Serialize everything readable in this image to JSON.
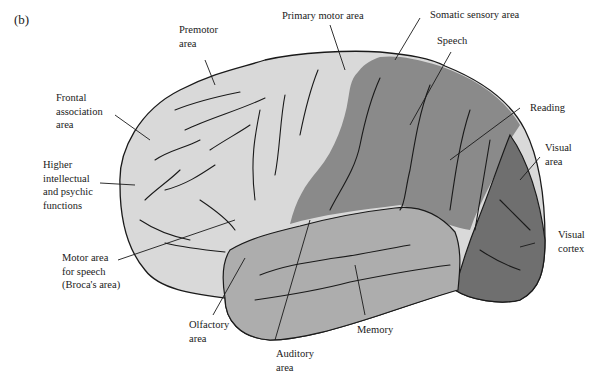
{
  "figure": {
    "panel_label": "(b)",
    "colors": {
      "frontal_light": "#d9d9d9",
      "sensory_dark": "#8a8a8a",
      "temporal_mid": "#adadad",
      "visual_darkest": "#6f6f6f",
      "outline": "#1a1a1a",
      "background": "#ffffff"
    },
    "labels": {
      "premotor": "Premotor\narea",
      "primary_motor": "Primary motor area",
      "somatic_sensory": "Somatic sensory area",
      "speech": "Speech",
      "frontal_association": "Frontal\nassociation\narea",
      "higher_intellectual": "Higher\nintellectual\nand psychic\nfunctions",
      "reading": "Reading",
      "visual_area": "Visual\narea",
      "visual_cortex": "Visual\ncortex",
      "broca": "Motor area\nfor speech\n(Broca's area)",
      "olfactory": "Olfactory\narea",
      "memory": "Memory",
      "auditory": "Auditory\narea"
    }
  }
}
